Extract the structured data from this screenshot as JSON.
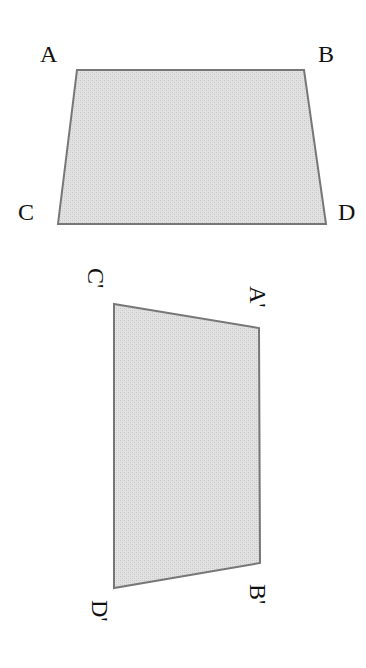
{
  "diagram": {
    "type": "geometric-transformation",
    "colors": {
      "fill": "#dcdcdc",
      "stroke": "#777777",
      "label": "#111111"
    },
    "original": {
      "vertices": [
        {
          "label": "A",
          "x": 77,
          "y": 70
        },
        {
          "label": "B",
          "x": 304,
          "y": 70
        },
        {
          "label": "D",
          "x": 326,
          "y": 224
        },
        {
          "label": "C",
          "x": 58,
          "y": 224
        }
      ],
      "labels": {
        "A": "A",
        "B": "B",
        "C": "C",
        "D": "D"
      }
    },
    "image": {
      "vertices": [
        {
          "label": "C'",
          "x": 114,
          "y": 304
        },
        {
          "label": "A'",
          "x": 259,
          "y": 328
        },
        {
          "label": "B'",
          "x": 260,
          "y": 563
        },
        {
          "label": "D'",
          "x": 114,
          "y": 588
        }
      ],
      "labels": {
        "A": "A'",
        "B": "B'",
        "C": "C'",
        "D": "D'"
      }
    }
  }
}
